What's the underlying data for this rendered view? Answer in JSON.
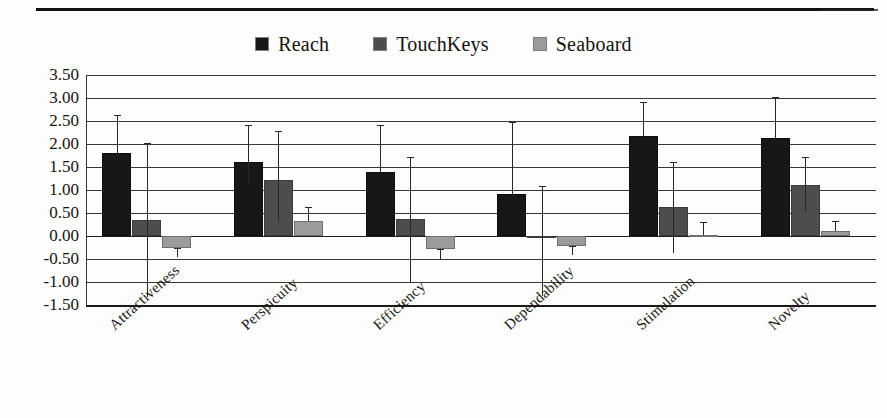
{
  "figure": {
    "legend": [
      {
        "label": "Reach",
        "color": "#171717",
        "swatch_name": "legend-swatch-reach"
      },
      {
        "label": "TouchKeys",
        "color": "#4d4d4d",
        "swatch_name": "legend-swatch-touchkeys"
      },
      {
        "label": "Seaboard",
        "color": "#9b9b9b",
        "swatch_name": "legend-swatch-seaboard"
      }
    ]
  },
  "chart_data": {
    "type": "bar",
    "title": "",
    "subtitle": "",
    "xlabel": "",
    "ylabel": "",
    "orientation": "vertical",
    "grouped": true,
    "grid": true,
    "legend_position": "top-center",
    "ylim": [
      -1.5,
      3.5
    ],
    "ytick_step": 0.5,
    "ytick_labels": [
      "3.50",
      "3.00",
      "2.50",
      "2.00",
      "1.50",
      "1.00",
      "0.50",
      "0.00",
      "-0.50",
      "-1.00",
      "-1.50"
    ],
    "ytick_values": [
      3.5,
      3.0,
      2.5,
      2.0,
      1.5,
      1.0,
      0.5,
      0.0,
      -0.5,
      -1.0,
      -1.5
    ],
    "categories": [
      "Attractiveness",
      "Perspicuity",
      "Efficiency",
      "Dependability",
      "Stimulation",
      "Novelty"
    ],
    "series": [
      {
        "name": "Reach",
        "color": "#171717",
        "values": [
          1.8,
          1.6,
          1.4,
          0.92,
          2.18,
          2.14
        ],
        "err_low": [
          1.8,
          1.15,
          1.4,
          0.92,
          2.18,
          2.14
        ],
        "err_high": [
          2.62,
          2.42,
          2.42,
          2.48,
          2.92,
          3.02
        ]
      },
      {
        "name": "TouchKeys",
        "color": "#4d4d4d",
        "values": [
          0.35,
          1.22,
          0.38,
          -0.05,
          0.62,
          1.1
        ],
        "err_low": [
          -1.32,
          0.3,
          -1.02,
          -1.3,
          -0.38,
          0.52
        ],
        "err_high": [
          2.02,
          2.28,
          1.72,
          1.08,
          1.6,
          1.72
        ]
      },
      {
        "name": "Seaboard",
        "color": "#9b9b9b",
        "values": [
          -0.25,
          0.33,
          -0.28,
          -0.22,
          0.02,
          0.1
        ],
        "err_low": [
          -0.45,
          0.33,
          -0.5,
          -0.42,
          0.02,
          0.1
        ],
        "err_high": [
          -0.25,
          0.62,
          -0.28,
          -0.22,
          0.3,
          0.32
        ]
      }
    ]
  }
}
